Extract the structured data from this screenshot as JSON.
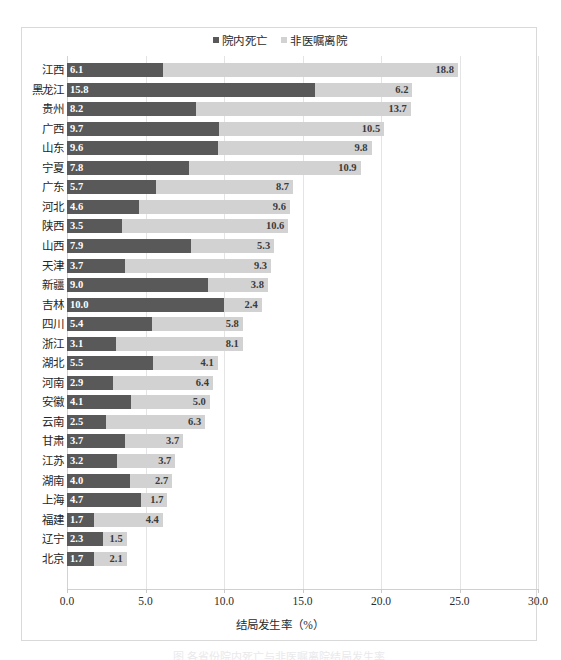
{
  "legend": {
    "position": "top-center",
    "entries": [
      {
        "label": "院内死亡",
        "icon": "square-marker-icon",
        "color": "#595959"
      },
      {
        "label": "非医嘱离院",
        "icon": "square-marker-icon",
        "color": "#d2d2d2"
      }
    ]
  },
  "axis": {
    "title": "结局发生率（%）",
    "ticks": [
      "0.0",
      "5.0",
      "10.0",
      "15.0",
      "20.0",
      "25.0",
      "30.0"
    ]
  },
  "caption": "图  各省份院内死亡与非医嘱离院结局发生率",
  "colors": {
    "series_in_hospital_death": "#595959",
    "series_non_medical_discharge": "#d2d2d2",
    "grid": "#e4e4e4",
    "frame": "#d9d9d9",
    "text": "#262626"
  },
  "chart_data": {
    "type": "bar",
    "orientation": "horizontal",
    "stacked": true,
    "title": "",
    "subtitle": "",
    "xlabel": "结局发生率（%）",
    "ylabel": "",
    "xlim": [
      0.0,
      30.0
    ],
    "xticks": [
      0.0,
      5.0,
      10.0,
      15.0,
      20.0,
      25.0,
      30.0
    ],
    "grid": true,
    "legend_position": "top-center",
    "categories": [
      "江西",
      "黑龙江",
      "贵州",
      "广西",
      "山东",
      "宁夏",
      "广东",
      "河北",
      "陕西",
      "山西",
      "天津",
      "新疆",
      "吉林",
      "四川",
      "浙江",
      "湖北",
      "河南",
      "安徽",
      "云南",
      "甘肃",
      "江苏",
      "湖南",
      "上海",
      "福建",
      "辽宁",
      "北京"
    ],
    "series": [
      {
        "name": "院内死亡",
        "color": "#595959",
        "values": [
          6.1,
          15.8,
          8.2,
          9.7,
          9.6,
          7.8,
          5.7,
          4.6,
          3.5,
          7.9,
          3.7,
          9.0,
          10.0,
          5.4,
          3.1,
          5.5,
          2.9,
          4.1,
          2.5,
          3.7,
          3.2,
          4.0,
          4.7,
          1.7,
          2.3,
          1.7
        ]
      },
      {
        "name": "非医嘱离院",
        "color": "#d2d2d2",
        "values": [
          18.8,
          6.2,
          13.7,
          10.5,
          9.8,
          10.9,
          8.7,
          9.6,
          10.6,
          5.3,
          9.3,
          3.8,
          2.4,
          5.8,
          8.1,
          4.1,
          6.4,
          5.0,
          6.3,
          3.7,
          3.7,
          2.7,
          1.7,
          4.4,
          1.5,
          2.1
        ]
      }
    ],
    "data_labels": [
      {
        "category": "江西",
        "院内死亡": "6.1",
        "非医嘱离院": "18.8"
      },
      {
        "category": "黑龙江",
        "院内死亡": "15.8",
        "非医嘱离院": "6.2"
      },
      {
        "category": "贵州",
        "院内死亡": "8.2",
        "非医嘱离院": "13.7"
      },
      {
        "category": "广西",
        "院内死亡": "9.7",
        "非医嘱离院": "10.5"
      },
      {
        "category": "山东",
        "院内死亡": "9.6",
        "非医嘱离院": "9.8"
      },
      {
        "category": "宁夏",
        "院内死亡": "7.8",
        "非医嘱离院": "10.9"
      },
      {
        "category": "广东",
        "院内死亡": "5.7",
        "非医嘱离院": "8.7"
      },
      {
        "category": "河北",
        "院内死亡": "4.6",
        "非医嘱离院": "9.6"
      },
      {
        "category": "陕西",
        "院内死亡": "3.5",
        "非医嘱离院": "10.6"
      },
      {
        "category": "山西",
        "院内死亡": "7.9",
        "非医嘱离院": "5.3"
      },
      {
        "category": "天津",
        "院内死亡": "3.7",
        "非医嘱离院": "9.3"
      },
      {
        "category": "新疆",
        "院内死亡": "9.0",
        "非医嘱离院": "3.8"
      },
      {
        "category": "吉林",
        "院内死亡": "10.0",
        "非医嘱离院": "2.4"
      },
      {
        "category": "四川",
        "院内死亡": "5.4",
        "非医嘱离院": "5.8"
      },
      {
        "category": "浙江",
        "院内死亡": "3.1",
        "非医嘱离院": "8.1"
      },
      {
        "category": "湖北",
        "院内死亡": "5.5",
        "非医嘱离院": "4.1"
      },
      {
        "category": "河南",
        "院内死亡": "2.9",
        "非医嘱离院": "6.4"
      },
      {
        "category": "安徽",
        "院内死亡": "4.1",
        "非医嘱离院": "5.0"
      },
      {
        "category": "云南",
        "院内死亡": "2.5",
        "非医嘱离院": "6.3"
      },
      {
        "category": "甘肃",
        "院内死亡": "3.7",
        "非医嘱离院": "3.7"
      },
      {
        "category": "江苏",
        "院内死亡": "3.2",
        "非医嘱离院": "3.7"
      },
      {
        "category": "湖南",
        "院内死亡": "4.0",
        "非医嘱离院": "2.7"
      },
      {
        "category": "上海",
        "院内死亡": "4.7",
        "非医嘱离院": "1.7"
      },
      {
        "category": "福建",
        "院内死亡": "1.7",
        "非医嘱离院": "4.4"
      },
      {
        "category": "辽宁",
        "院内死亡": "2.3",
        "非医嘱离院": "1.5"
      },
      {
        "category": "北京",
        "院内死亡": "1.7",
        "非医嘱离院": "2.1"
      }
    ]
  }
}
